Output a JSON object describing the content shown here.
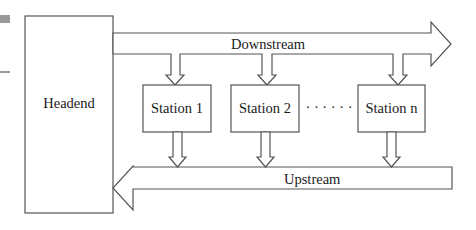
{
  "diagram": {
    "headend": {
      "label": "Headend"
    },
    "downstream": {
      "label": "Downstream"
    },
    "upstream": {
      "label": "Upstream"
    },
    "stations": [
      {
        "label": "Station 1"
      },
      {
        "label": "Station 2"
      },
      {
        "label": "Station n"
      }
    ],
    "ellipsis": "· · · · · ·"
  },
  "colors": {
    "stroke": "#555555",
    "text": "#1a1a1a",
    "background": "#ffffff",
    "edge_marker": "#999999"
  }
}
